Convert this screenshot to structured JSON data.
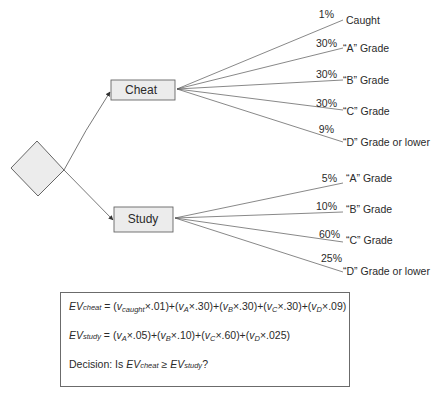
{
  "decision_node": {
    "shape": "diamond",
    "fill": "#ececec",
    "stroke": "#555555"
  },
  "options": [
    {
      "label": "Cheat",
      "box": {
        "x": 111,
        "y": 80,
        "w": 64,
        "h": 20
      },
      "outcomes": [
        {
          "probability": "1%",
          "label": "Caught"
        },
        {
          "probability": "30%",
          "label": "“A” Grade"
        },
        {
          "probability": "30%",
          "label": "“B” Grade"
        },
        {
          "probability": "30%",
          "label": "“C” Grade"
        },
        {
          "probability": "9%",
          "label": "“D” Grade or lower"
        }
      ]
    },
    {
      "label": "Study",
      "box": {
        "x": 114,
        "y": 207,
        "w": 59,
        "h": 25
      },
      "outcomes": [
        {
          "probability": "5%",
          "label": "“A” Grade"
        },
        {
          "probability": "10%",
          "label": "“B” Grade"
        },
        {
          "probability": "60%",
          "label": "“C” Grade"
        },
        {
          "probability": "25%",
          "label": "“D” Grade or lower"
        }
      ]
    }
  ],
  "formulas": {
    "ev_cheat": {
      "lhs": "EV",
      "lhs_sub": "cheat",
      "eq": " = ",
      "terms": [
        {
          "v": "v",
          "sub": "caught",
          "coef": ".01"
        },
        {
          "v": "v",
          "sub": "A",
          "coef": ".30"
        },
        {
          "v": "v",
          "sub": "B",
          "coef": ".30"
        },
        {
          "v": "v",
          "sub": "C",
          "coef": ".30"
        },
        {
          "v": "v",
          "sub": "D",
          "coef": ".09"
        }
      ]
    },
    "ev_study": {
      "lhs": "EV",
      "lhs_sub": "study",
      "eq": " = ",
      "terms": [
        {
          "v": "v",
          "sub": "A",
          "coef": ".05"
        },
        {
          "v": "v",
          "sub": "B",
          "coef": ".10"
        },
        {
          "v": "v",
          "sub": "C",
          "coef": ".60"
        },
        {
          "v": "v",
          "sub": "D",
          "coef": ".025"
        }
      ]
    },
    "decision": {
      "prefix": "Decision: Is ",
      "left": "EV",
      "left_sub": "cheat",
      "op": " ≥ ",
      "right": "EV",
      "right_sub": "study",
      "suffix": "?"
    }
  },
  "colors": {
    "line": "#555555",
    "box_fill": "#ececec",
    "box_stroke": "#666666",
    "text": "#2a2a2a"
  }
}
